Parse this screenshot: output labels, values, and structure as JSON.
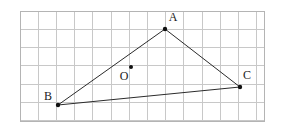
{
  "figure": {
    "kind": "geometry-diagram",
    "background_color": "#ffffff",
    "grid": {
      "line_color": "#c8c8c8",
      "border_color": "#b4b4b4",
      "line_width": 1,
      "cell_size": 18.2,
      "origin_x": 20,
      "origin_y": 11,
      "columns": 13,
      "rows": 6,
      "width": 244,
      "height": 110,
      "x_lines": [
        20,
        38.2,
        56.4,
        74.6,
        92.8,
        111,
        129.2,
        147.4,
        165.6,
        183.8,
        202,
        220.2,
        238.4,
        256.6,
        264
      ],
      "y_lines": [
        11,
        29.3,
        47.6,
        65.9,
        84.2,
        102.5,
        120.8
      ]
    },
    "shape": {
      "name": "triangle-abc",
      "stroke_color": "#2b2b2b",
      "stroke_width": 1,
      "fill": "none"
    },
    "points": [
      {
        "id": "A",
        "label": "A",
        "x": 165,
        "y": 29,
        "label_x": 173,
        "label_y": 18,
        "dot_radius": 2.2,
        "dot_color": "#111111",
        "is_vertex": true
      },
      {
        "id": "B",
        "label": "B",
        "x": 58,
        "y": 105,
        "label_x": 48,
        "label_y": 97,
        "dot_radius": 2.2,
        "dot_color": "#111111",
        "is_vertex": true
      },
      {
        "id": "C",
        "label": "C",
        "x": 240,
        "y": 87,
        "label_x": 247,
        "label_y": 76,
        "dot_radius": 2.2,
        "dot_color": "#111111",
        "is_vertex": true
      },
      {
        "id": "O",
        "label": "O",
        "x": 131,
        "y": 67,
        "label_x": 124,
        "label_y": 77,
        "dot_radius": 2.0,
        "dot_color": "#111111",
        "is_vertex": false
      }
    ],
    "segments": [
      {
        "name": "segment-ab",
        "from": "B",
        "to": "A"
      },
      {
        "name": "segment-ac",
        "from": "A",
        "to": "C"
      },
      {
        "name": "segment-bc",
        "from": "B",
        "to": "C"
      }
    ]
  }
}
